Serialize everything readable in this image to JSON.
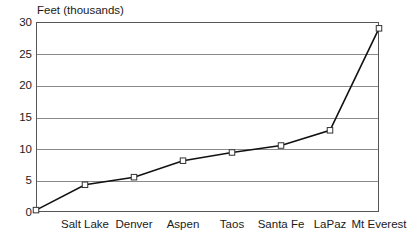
{
  "chart_data": {
    "type": "line",
    "title": "Feet (thousands)",
    "xlabel": "",
    "ylabel": "Feet (thousands)",
    "ylim": [
      0,
      30
    ],
    "yticks": [
      0,
      5,
      10,
      15,
      20,
      25,
      30
    ],
    "grid": true,
    "legend": "none",
    "categories": [
      "",
      "Salt Lake",
      "Denver",
      "Aspen",
      "Taos",
      "Santa Fe",
      "LaPaz",
      "Mt Everest"
    ],
    "values": [
      0.3,
      4.3,
      5.5,
      8.1,
      9.4,
      10.5,
      12.9,
      29.0
    ],
    "series": [
      {
        "name": "Elevation",
        "values": [
          0.3,
          4.3,
          5.5,
          8.1,
          9.4,
          10.5,
          12.9,
          29.0
        ]
      }
    ],
    "tick_labels": [
      "Salt Lake",
      "Denver",
      "Aspen",
      "Taos",
      "Santa Fe",
      "LaPaz",
      "Mt Everest"
    ],
    "marker": "open-square",
    "colors": {
      "line": "#111111",
      "marker_fill": "#ffffff",
      "marker_stroke": "#333333",
      "gridline": "#8a8a8a",
      "frame": "#555555",
      "text": "#1a1a1a",
      "background": "#ffffff"
    }
  }
}
